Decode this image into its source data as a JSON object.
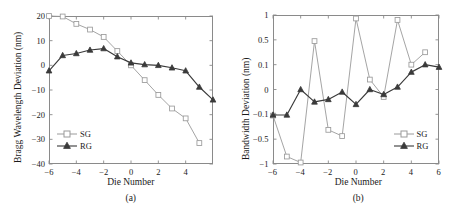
{
  "figure": {
    "panels": [
      {
        "id": "a",
        "panel_label": "(a)",
        "xlabel": "Die Number",
        "ylabel": "Bragg Wavelength Deviation (nm)",
        "legend": [
          {
            "name": "SG",
            "marker": "open-square-marker",
            "color": "#9a9a9a"
          },
          {
            "name": "RG",
            "marker": "filled-triangle-marker",
            "color": "#3a3a3a"
          }
        ]
      },
      {
        "id": "b",
        "panel_label": "(b)",
        "xlabel": "Die Number",
        "ylabel": "Bandwidth Deviation (nm)",
        "legend": [
          {
            "name": "SG",
            "marker": "open-square-marker",
            "color": "#9a9a9a"
          },
          {
            "name": "RG",
            "marker": "filled-triangle-marker",
            "color": "#3a3a3a"
          }
        ]
      }
    ]
  },
  "chart_data": [
    {
      "type": "line",
      "id": "panel-a",
      "title": "(a)",
      "xlabel": "Die Number",
      "ylabel": "Bragg Wavelength Deviation (nm)",
      "xlim": [
        -6,
        6
      ],
      "ylim": [
        -40,
        20
      ],
      "xticks": [
        -6,
        -4,
        -2,
        0,
        2,
        4
      ],
      "yticks": [
        -40,
        -30,
        -20,
        -10,
        0,
        10,
        20
      ],
      "xtick_labels": [
        "−6",
        "−4",
        "−2",
        "0",
        "2",
        "4"
      ],
      "ytick_labels": [
        "−40",
        "−30",
        "−20",
        "−10",
        "0",
        "10",
        "20"
      ],
      "grid": false,
      "legend_position": "lower-left",
      "yscale": "linear",
      "series": [
        {
          "name": "SG",
          "marker": "open-square-marker",
          "color": "#9a9a9a",
          "x": [
            -6,
            -5,
            -4,
            -3,
            -2,
            -1,
            0,
            1,
            2,
            3,
            4,
            5
          ],
          "values": [
            20,
            19.8,
            16.8,
            14.5,
            11.5,
            5.8,
            0.0,
            -6.0,
            -12.0,
            -17.5,
            -21.5,
            -31.5
          ]
        },
        {
          "name": "RG",
          "marker": "filled-triangle-marker",
          "color": "#3a3a3a",
          "x": [
            -6,
            -5,
            -4,
            -3,
            -2,
            -1,
            0,
            1,
            2,
            3,
            4,
            5,
            6
          ],
          "values": [
            -2.2,
            4.0,
            4.8,
            6.2,
            6.8,
            3.5,
            1.0,
            0.3,
            0.0,
            -1.0,
            -2.2,
            -8.8,
            -14.0
          ]
        }
      ]
    },
    {
      "type": "line",
      "id": "panel-b",
      "title": "(b)",
      "xlabel": "Die Number",
      "ylabel": "Bandwidth Deviation (nm)",
      "xlim": [
        -6,
        6
      ],
      "ylim": [
        -1,
        1
      ],
      "xticks": [
        -6,
        -4,
        -2,
        0,
        2,
        4,
        6
      ],
      "yticks": [
        -1,
        -0.5,
        -0.1,
        0,
        0.1,
        0.5,
        1
      ],
      "xtick_labels": [
        "−6",
        "−4",
        "−2",
        "0",
        "2",
        "4",
        "6"
      ],
      "ytick_labels": [
        "−1",
        "−0.5",
        "−0.1",
        "0",
        "0.1",
        "0.5",
        "1"
      ],
      "grid": false,
      "legend_position": "lower-right",
      "yscale": "nonuniform-compressed-near-zero",
      "series": [
        {
          "name": "SG",
          "marker": "open-square-marker",
          "color": "#9a9a9a",
          "x": [
            -6,
            -5,
            -4,
            -3,
            -2,
            -1,
            0,
            1,
            2,
            3,
            4,
            5
          ],
          "values": [
            -0.12,
            -0.85,
            -0.97,
            0.48,
            -0.35,
            -0.45,
            0.93,
            0.04,
            -0.03,
            0.9,
            0.1,
            0.3
          ]
        },
        {
          "name": "RG",
          "marker": "filled-triangle-marker",
          "color": "#3a3a3a",
          "x": [
            -6,
            -5,
            -4,
            -3,
            -2,
            -1,
            0,
            1,
            2,
            3,
            4,
            5,
            6
          ],
          "values": [
            -0.11,
            -0.11,
            0.0,
            -0.05,
            -0.04,
            -0.01,
            -0.06,
            0.0,
            -0.02,
            0.01,
            0.07,
            0.1,
            0.09
          ]
        }
      ]
    }
  ]
}
